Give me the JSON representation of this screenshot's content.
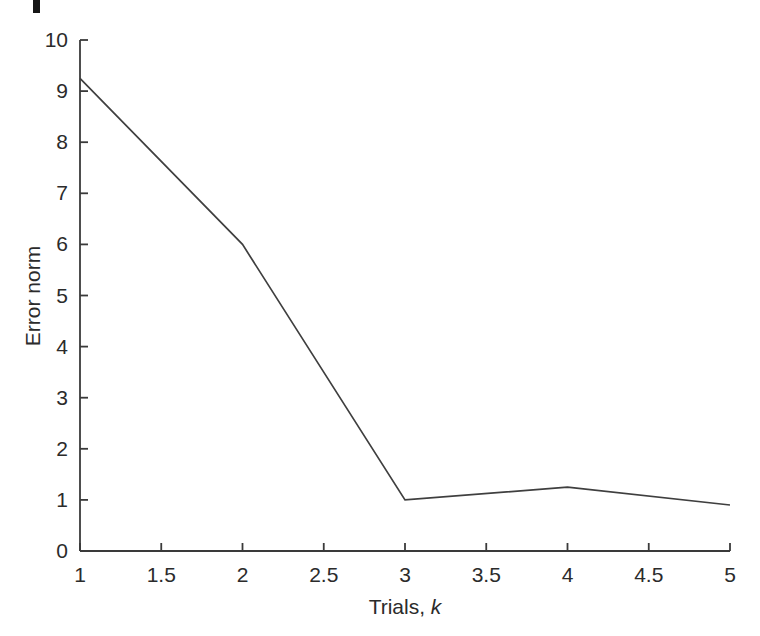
{
  "chart_data": {
    "type": "line",
    "title": "",
    "ylabel": "Error norm",
    "xlabel_prefix": "Trials, ",
    "xlabel_var": "k",
    "x": [
      1,
      2,
      3,
      4,
      5
    ],
    "y": [
      9.25,
      6.0,
      1.0,
      1.25,
      0.9
    ],
    "series_name": "error-norm-vs-trials",
    "xlim": [
      1,
      5
    ],
    "ylim": [
      0,
      10
    ],
    "xticks": [
      1,
      1.5,
      2,
      2.5,
      3,
      3.5,
      4,
      4.5,
      5
    ],
    "xtick_labels": [
      "1",
      "1.5",
      "2",
      "2.5",
      "3",
      "3.5",
      "4",
      "4.5",
      "5"
    ],
    "yticks": [
      0,
      1,
      2,
      3,
      4,
      5,
      6,
      7,
      8,
      9,
      10
    ],
    "ytick_labels": [
      "0",
      "1",
      "2",
      "3",
      "4",
      "5",
      "6",
      "7",
      "8",
      "9",
      "10"
    ],
    "grid": false,
    "legend": null,
    "line_color": "#3f3f3f",
    "axis_color": "#3a3a3a",
    "text_color": "#2b2b2b",
    "background": "#ffffff"
  }
}
